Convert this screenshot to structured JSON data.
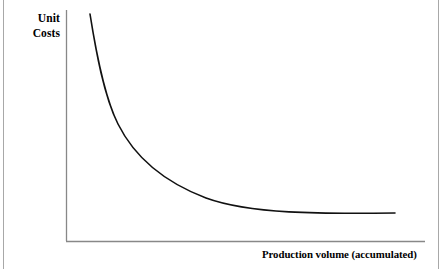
{
  "figure": {
    "width": 445,
    "height": 269,
    "background_color": "#ffffff",
    "border_color": "#a8a8a8"
  },
  "chart_data": {
    "type": "line",
    "title": "",
    "subtitle": "",
    "xlabel": "Production volume (accumulated)",
    "ylabel_line1": "Unit",
    "ylabel_line2": "Costs",
    "ylabel": "Unit Costs",
    "grid": false,
    "legend": null,
    "legend_position": "none",
    "axis_color": "#888888",
    "line_color": "#111111",
    "line_width": 1.6,
    "xlim": [
      0,
      100
    ],
    "ylim": [
      0,
      100
    ],
    "x_tick_labels": [],
    "y_tick_labels": [],
    "annotations": [],
    "series": [
      {
        "name": "Experience curve",
        "x": [
          7,
          9,
          11,
          14,
          18,
          23,
          29,
          36,
          44,
          53,
          62,
          71,
          80,
          89,
          92
        ],
        "y": [
          98,
          87,
          75,
          62,
          50,
          40,
          32,
          26,
          21,
          17,
          15,
          13,
          12,
          11.5,
          11.3
        ]
      }
    ],
    "curve_pixel_path": "M 90 14 C 96 52, 104 96, 118 124 C 134 156, 164 182, 206 198 C 250 214, 320 214, 395 213"
  }
}
